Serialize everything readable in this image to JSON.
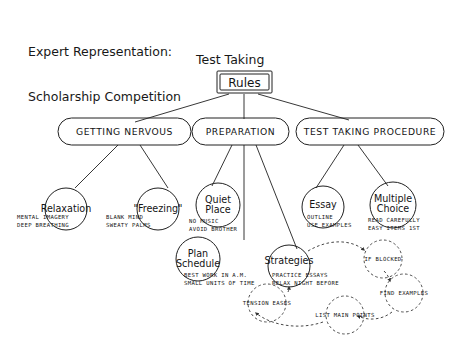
{
  "page": {
    "title_line1": "Expert Representation:",
    "title_line2": "Scholarship Competition",
    "diagram_title": "Test Taking",
    "background": "#ffffff",
    "ink": "#202020"
  },
  "root": {
    "label": "Rules",
    "shape": "rectangle"
  },
  "branches": [
    {
      "label": "GETTING  NERVOUS",
      "shape": "stadium"
    },
    {
      "label": "PREPARATION",
      "shape": "stadium"
    },
    {
      "label": "TEST TAKING PROCEDURE",
      "shape": "stadium"
    }
  ],
  "leaves": [
    {
      "label_lines": [
        "Relaxation"
      ],
      "shape": "circle",
      "parent": "GETTING  NERVOUS",
      "details": [
        "MENTAL IMAGERY",
        "DEEP BREATHING"
      ]
    },
    {
      "label_lines": [
        "\"Freezing\""
      ],
      "shape": "circle",
      "parent": "GETTING  NERVOUS",
      "details": [
        "BLANK MIND",
        "SWEATY PALMS"
      ]
    },
    {
      "label_lines": [
        "Quiet",
        "Place"
      ],
      "shape": "circle",
      "parent": "PREPARATION",
      "details": [
        "NO MUSIC",
        "AVOID BROTHER"
      ]
    },
    {
      "label_lines": [
        "Plan",
        "Schedule"
      ],
      "shape": "circle",
      "parent": "PREPARATION",
      "details": [
        "BEST WORK IN A.M.",
        "SMALL UNITS OF TIME"
      ]
    },
    {
      "label_lines": [
        "Strategies"
      ],
      "shape": "circle",
      "parent": "PREPARATION",
      "details": [
        "PRACTICE ESSAYS",
        "RELAX NIGHT BEFORE"
      ]
    },
    {
      "label_lines": [
        "Essay"
      ],
      "shape": "circle",
      "parent": "TEST TAKING PROCEDURE",
      "details": [
        "OUTLINE",
        "USE EXAMPLES"
      ]
    },
    {
      "label_lines": [
        "Multiple",
        "Choice"
      ],
      "shape": "circle",
      "parent": "TEST TAKING PROCEDURE",
      "details": [
        "READ CAREFULLY",
        "EASY ITEMS 1ST"
      ]
    }
  ],
  "dashed_nodes": [
    {
      "label": "IF BLOCKED",
      "shape": "dashed-circle"
    },
    {
      "label": "FIND EXAMPLES",
      "shape": "dashed-circle"
    },
    {
      "label": "LIST MAIN POINTS",
      "shape": "dashed-circle"
    },
    {
      "label": "TENSION EASES",
      "shape": "dashed-circle"
    }
  ],
  "dashed_flow": [
    {
      "from": "Strategies",
      "to": "IF BLOCKED"
    },
    {
      "from": "IF BLOCKED",
      "to": "FIND EXAMPLES"
    },
    {
      "from": "FIND EXAMPLES",
      "to": "LIST MAIN POINTS"
    },
    {
      "from": "LIST MAIN POINTS",
      "to": "TENSION EASES"
    },
    {
      "from": "TENSION EASES",
      "to": "Strategies"
    }
  ]
}
